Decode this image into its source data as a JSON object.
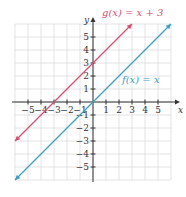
{
  "chart_data": {
    "type": "line",
    "title": "",
    "xlabel": "x",
    "ylabel": "y",
    "xlim": [
      -6,
      6
    ],
    "ylim": [
      -6,
      6
    ],
    "grid": true,
    "x_ticks": [
      -5,
      -4,
      -3,
      -2,
      -1,
      1,
      2,
      3,
      4,
      5
    ],
    "y_ticks": [
      -5,
      -4,
      -3,
      -2,
      -1,
      1,
      2,
      3,
      4,
      5
    ],
    "x_tick_labels": [
      "−5",
      "−4",
      "−3",
      "−2",
      "−1",
      "1",
      "2",
      "3",
      "4",
      "5"
    ],
    "y_tick_labels": [
      "−5",
      "−4",
      "−3",
      "−2",
      "−1",
      "1",
      "2",
      "3",
      "4",
      "5"
    ],
    "series": [
      {
        "name": "g(x) = x + 3",
        "label": "g(x) = x + 3",
        "color": "#d64f72",
        "x": [
          -6,
          3
        ],
        "y": [
          -3,
          6
        ]
      },
      {
        "name": "f(x) = x",
        "label": "f(x) = x",
        "color": "#3d9fc8",
        "x": [
          -6,
          6
        ],
        "y": [
          -6,
          6
        ]
      }
    ]
  },
  "axes": {
    "x_label": "x",
    "y_label": "y"
  }
}
